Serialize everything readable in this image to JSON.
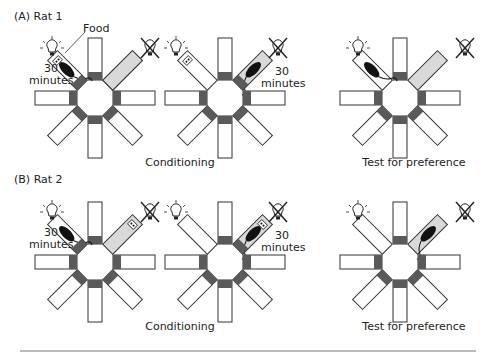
{
  "panels": [
    {
      "id": "A",
      "label": "(A)  Rat 1"
    },
    {
      "id": "B",
      "label": "(B)  Rat 2"
    }
  ],
  "captions": {
    "conditioning": "Conditioning",
    "test": "Test for preference"
  },
  "annotations": {
    "food": "Food",
    "time_line1": "30",
    "time_line2": "minutes"
  },
  "colors": {
    "arm_gate": "#5a5a5a",
    "lit_arm_fill": "#ffffff",
    "dark_arm_fill": "#d9d9d9",
    "outline": "#333333",
    "rat": "#111111",
    "rule": "#777777"
  },
  "icons": {
    "light_on": "lightbulb-on-icon",
    "light_off": "lightbulb-off-icon",
    "rat": "rat-icon",
    "food": "food-pellet-icon"
  },
  "mazes": [
    {
      "row": "A",
      "col": 1,
      "phase": "Conditioning",
      "cx": 95,
      "cy": 98,
      "rat_arm": "NW",
      "food_arm": "NW",
      "time_side": "left"
    },
    {
      "row": "A",
      "col": 2,
      "phase": "Conditioning",
      "cx": 225,
      "cy": 98,
      "rat_arm": "NE",
      "food_arm": "NW",
      "time_side": "right"
    },
    {
      "row": "A",
      "col": 3,
      "phase": "Test for preference",
      "cx": 400,
      "cy": 98,
      "rat_arm": "NW",
      "food_arm": null,
      "time_side": null
    },
    {
      "row": "B",
      "col": 1,
      "phase": "Conditioning",
      "cx": 95,
      "cy": 262,
      "rat_arm": "NW",
      "food_arm": "NE",
      "time_side": "left"
    },
    {
      "row": "B",
      "col": 2,
      "phase": "Conditioning",
      "cx": 225,
      "cy": 262,
      "rat_arm": "NE",
      "food_arm": "NE",
      "time_side": "right"
    },
    {
      "row": "B",
      "col": 3,
      "phase": "Test for preference",
      "cx": 400,
      "cy": 262,
      "rat_arm": "NE",
      "food_arm": null,
      "time_side": null
    }
  ]
}
